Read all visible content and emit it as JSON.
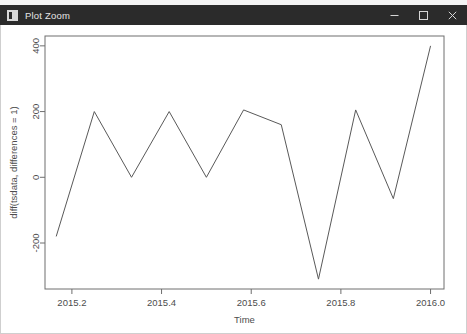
{
  "window": {
    "title": "Plot Zoom",
    "icon": "plot-window-icon",
    "controls": [
      {
        "name": "minimize-button",
        "glyph": "minimize-icon",
        "label": "Minimize"
      },
      {
        "name": "maximize-button",
        "glyph": "maximize-icon",
        "label": "Maximize"
      },
      {
        "name": "close-button",
        "glyph": "close-icon",
        "label": "Close"
      }
    ]
  },
  "colors": {
    "titlebar_background": "#2b2b2b",
    "titlebar_text": "#e6e6e6",
    "plot_background": "#ffffff",
    "axis": "#6e6e6e",
    "line": "#595959",
    "tick_text": "#4d4d4d",
    "window_border": "#cfcfcf"
  },
  "chart_data": {
    "type": "line",
    "title": "",
    "xlabel": "Time",
    "ylabel": "diff(tsdata, differences = 1)",
    "xlim": [
      2015.14,
      2016.03
    ],
    "ylim": [
      -340,
      430
    ],
    "xticks": [
      2015.2,
      2015.4,
      2015.6,
      2015.8,
      2016.0
    ],
    "xtick_labels": [
      "2015.2",
      "2015.4",
      "2015.6",
      "2015.8",
      "2016.0"
    ],
    "yticks": [
      -200,
      0,
      200,
      400
    ],
    "ytick_labels": [
      "-200",
      "0",
      "200",
      "400"
    ],
    "grid": false,
    "legend": false,
    "series": [
      {
        "name": "diff(tsdata, differences = 1)",
        "x": [
          2015.165,
          2015.25,
          2015.333,
          2015.417,
          2015.5,
          2015.583,
          2015.667,
          2015.75,
          2015.833,
          2015.917,
          2016.0
        ],
        "y": [
          -180,
          200,
          0,
          200,
          0,
          205,
          160,
          -310,
          205,
          -65,
          400
        ]
      }
    ]
  }
}
